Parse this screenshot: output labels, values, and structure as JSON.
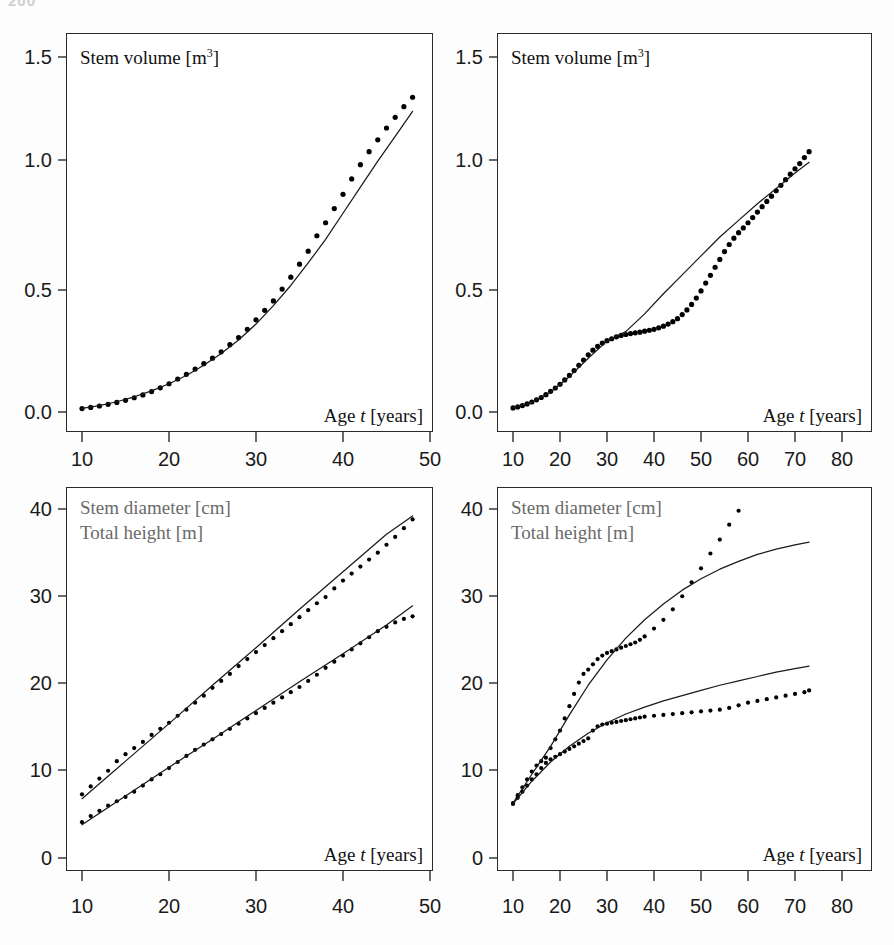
{
  "page": {
    "number": "200"
  },
  "figure": {
    "panels": [
      {
        "id": "top-left",
        "captions": {
          "title": "Stem volume [m",
          "title_sup": "3",
          "title_end": "]",
          "xlabel_a": "Age ",
          "xlabel_t": "t",
          "xlabel_b": " [years]"
        },
        "yticks": [
          "0.0",
          "0.5",
          "1.0",
          "1.5"
        ],
        "xticks": [
          "10",
          "20",
          "30",
          "40",
          "50"
        ]
      },
      {
        "id": "top-right",
        "captions": {
          "title": "Stem volume [m",
          "title_sup": "3",
          "title_end": "]",
          "xlabel_a": "Age ",
          "xlabel_t": "t",
          "xlabel_b": " [years]"
        },
        "yticks": [
          "0.0",
          "0.5",
          "1.0",
          "1.5"
        ],
        "xticks": [
          "10",
          "20",
          "30",
          "40",
          "50",
          "60",
          "70",
          "80"
        ]
      },
      {
        "id": "bottom-left",
        "captions": {
          "title1": "Stem diameter [cm]",
          "title2": "Total height [m]",
          "xlabel_a": "Age ",
          "xlabel_t": "t",
          "xlabel_b": " [years]"
        },
        "yticks": [
          "0",
          "10",
          "20",
          "30",
          "40"
        ],
        "xticks": [
          "10",
          "20",
          "30",
          "40",
          "50"
        ]
      },
      {
        "id": "bottom-right",
        "captions": {
          "title1": "Stem diameter [cm]",
          "title2": "Total height [m]",
          "xlabel_a": "Age ",
          "xlabel_t": "t",
          "xlabel_b": " [years]"
        },
        "yticks": [
          "0",
          "10",
          "20",
          "30",
          "40"
        ],
        "xticks": [
          "10",
          "20",
          "30",
          "40",
          "50",
          "60",
          "70",
          "80"
        ]
      }
    ]
  },
  "colors": {
    "frame": "#2a2a2a",
    "curve": "#1a1a1a",
    "marker": "#000000",
    "caption_gray": "#6a6a6a",
    "background": "#ffffff"
  },
  "chart_data": [
    {
      "type": "line",
      "panel": "top-left",
      "title": "Stem volume [m3]",
      "xlabel": "Age t [years]",
      "ylabel": "Stem volume [m3]",
      "xlim": [
        10,
        50
      ],
      "ylim": [
        0.0,
        1.5
      ],
      "xticks": [
        10,
        20,
        30,
        40,
        50
      ],
      "yticks": [
        0.0,
        0.5,
        1.0,
        1.5
      ],
      "grid": false,
      "legend": "none",
      "series": [
        {
          "name": "Observed stem volume (points)",
          "style": "points",
          "x": [
            10,
            11,
            12,
            13,
            14,
            15,
            16,
            17,
            18,
            19,
            20,
            21,
            22,
            23,
            24,
            25,
            26,
            27,
            28,
            29,
            30,
            31,
            32,
            33,
            34,
            35,
            36,
            37,
            38,
            39,
            40,
            41,
            42,
            43,
            44,
            45,
            46,
            47,
            48
          ],
          "y": [
            0.015,
            0.02,
            0.026,
            0.033,
            0.041,
            0.05,
            0.061,
            0.073,
            0.087,
            0.103,
            0.12,
            0.14,
            0.16,
            0.182,
            0.205,
            0.228,
            0.255,
            0.285,
            0.315,
            0.35,
            0.39,
            0.43,
            0.47,
            0.52,
            0.57,
            0.625,
            0.68,
            0.745,
            0.8,
            0.86,
            0.92,
            0.985,
            1.045,
            1.1,
            1.15,
            1.2,
            1.245,
            1.29,
            1.33
          ]
        },
        {
          "name": "Model fit (solid line)",
          "style": "line",
          "x": [
            10,
            12,
            14,
            16,
            18,
            20,
            22,
            24,
            26,
            28,
            30,
            32,
            34,
            36,
            38,
            40,
            42,
            44,
            46,
            48
          ],
          "y": [
            0.016,
            0.028,
            0.044,
            0.065,
            0.09,
            0.12,
            0.155,
            0.198,
            0.248,
            0.305,
            0.372,
            0.45,
            0.535,
            0.63,
            0.73,
            0.84,
            0.95,
            1.06,
            1.165,
            1.27
          ]
        }
      ]
    },
    {
      "type": "line",
      "panel": "top-right",
      "title": "Stem volume [m3]",
      "xlabel": "Age t [years]",
      "ylabel": "Stem volume [m3]",
      "xlim": [
        10,
        80
      ],
      "ylim": [
        0.0,
        1.5
      ],
      "xticks": [
        10,
        20,
        30,
        40,
        50,
        60,
        70,
        80
      ],
      "yticks": [
        0.0,
        0.5,
        1.0,
        1.5
      ],
      "grid": false,
      "legend": "none",
      "series": [
        {
          "name": "Observed stem volume (points)",
          "style": "points",
          "x": [
            10,
            11,
            12,
            13,
            14,
            15,
            16,
            17,
            18,
            19,
            20,
            21,
            22,
            23,
            24,
            25,
            26,
            27,
            28,
            29,
            30,
            31,
            32,
            33,
            34,
            35,
            36,
            37,
            38,
            39,
            40,
            41,
            42,
            43,
            44,
            45,
            46,
            47,
            48,
            49,
            50,
            51,
            52,
            53,
            54,
            55,
            56,
            57,
            58,
            59,
            60,
            61,
            62,
            63,
            64,
            65,
            66,
            67,
            68,
            69,
            70,
            71,
            72,
            73
          ],
          "y": [
            0.018,
            0.022,
            0.028,
            0.035,
            0.043,
            0.052,
            0.062,
            0.074,
            0.088,
            0.102,
            0.118,
            0.136,
            0.155,
            0.176,
            0.198,
            0.22,
            0.242,
            0.262,
            0.278,
            0.292,
            0.302,
            0.31,
            0.318,
            0.324,
            0.328,
            0.332,
            0.335,
            0.338,
            0.342,
            0.346,
            0.35,
            0.356,
            0.363,
            0.372,
            0.382,
            0.395,
            0.412,
            0.432,
            0.455,
            0.482,
            0.512,
            0.545,
            0.578,
            0.612,
            0.645,
            0.678,
            0.708,
            0.735,
            0.758,
            0.778,
            0.8,
            0.822,
            0.845,
            0.868,
            0.89,
            0.912,
            0.935,
            0.958,
            0.982,
            1.005,
            1.028,
            1.05,
            1.075,
            1.1
          ]
        },
        {
          "name": "Model fit (solid line)",
          "style": "line",
          "x": [
            10,
            14,
            18,
            22,
            26,
            30,
            34,
            38,
            42,
            46,
            50,
            54,
            58,
            62,
            66,
            70,
            73
          ],
          "y": [
            0.018,
            0.042,
            0.085,
            0.15,
            0.228,
            0.3,
            0.34,
            0.415,
            0.5,
            0.58,
            0.66,
            0.74,
            0.81,
            0.88,
            0.945,
            1.01,
            1.055
          ]
        }
      ]
    },
    {
      "type": "line",
      "panel": "bottom-left",
      "title": "Stem diameter [cm] / Total height [m]",
      "xlabel": "Age t [years]",
      "ylabel": "Stem diameter [cm], Total height [m]",
      "xlim": [
        10,
        50
      ],
      "ylim": [
        0,
        40
      ],
      "xticks": [
        10,
        20,
        30,
        40,
        50
      ],
      "yticks": [
        0,
        10,
        20,
        30,
        40
      ],
      "grid": false,
      "legend": "none",
      "series": [
        {
          "name": "Observed stem diameter (points)",
          "style": "points",
          "x": [
            10,
            11,
            12,
            13,
            14,
            15,
            16,
            17,
            18,
            19,
            20,
            21,
            22,
            23,
            24,
            25,
            26,
            27,
            28,
            29,
            30,
            31,
            32,
            33,
            34,
            35,
            36,
            37,
            38,
            39,
            40,
            41,
            42,
            43,
            44,
            45,
            46,
            47,
            48
          ],
          "y": [
            7.3,
            8.2,
            9.1,
            10.0,
            11.1,
            11.9,
            12.6,
            13.3,
            14.1,
            14.8,
            15.5,
            16.3,
            17.0,
            17.8,
            18.6,
            19.5,
            20.3,
            21.1,
            22.0,
            22.8,
            23.6,
            24.4,
            25.2,
            26.0,
            26.8,
            27.6,
            28.4,
            29.2,
            29.9,
            30.9,
            31.8,
            32.6,
            33.4,
            34.2,
            35.0,
            35.9,
            36.8,
            37.8,
            38.8
          ]
        },
        {
          "name": "Model fit stem diameter (solid line)",
          "style": "line",
          "x": [
            10,
            15,
            20,
            25,
            30,
            35,
            40,
            45,
            48
          ],
          "y": [
            6.8,
            11.1,
            15.4,
            19.8,
            24.1,
            28.5,
            32.8,
            37.1,
            39.2
          ]
        },
        {
          "name": "Observed total height (points)",
          "style": "points",
          "x": [
            10,
            11,
            12,
            13,
            14,
            15,
            16,
            17,
            18,
            19,
            20,
            21,
            22,
            23,
            24,
            25,
            26,
            27,
            28,
            29,
            30,
            31,
            32,
            33,
            34,
            35,
            36,
            37,
            38,
            39,
            40,
            41,
            42,
            43,
            44,
            45,
            46,
            47,
            48
          ],
          "y": [
            4.1,
            4.8,
            5.4,
            6.0,
            6.5,
            7.0,
            7.6,
            8.3,
            9.0,
            9.6,
            10.3,
            11.0,
            11.7,
            12.4,
            13.0,
            13.6,
            14.2,
            14.8,
            15.4,
            16.0,
            16.6,
            17.2,
            17.8,
            18.4,
            19.0,
            19.6,
            20.3,
            21.0,
            21.8,
            22.5,
            23.2,
            23.9,
            24.6,
            25.3,
            26.0,
            26.5,
            27.0,
            27.4,
            27.7
          ]
        },
        {
          "name": "Model fit total height (solid line)",
          "style": "line",
          "x": [
            10,
            15,
            20,
            25,
            30,
            35,
            40,
            45,
            48
          ],
          "y": [
            3.8,
            7.1,
            10.4,
            13.6,
            16.9,
            20.2,
            23.4,
            26.7,
            28.9
          ]
        }
      ]
    },
    {
      "type": "line",
      "panel": "bottom-right",
      "title": "Stem diameter [cm] / Total height [m]",
      "xlabel": "Age t [years]",
      "ylabel": "Stem diameter [cm], Total height [m]",
      "xlim": [
        10,
        80
      ],
      "ylim": [
        0,
        40
      ],
      "xticks": [
        10,
        20,
        30,
        40,
        50,
        60,
        70,
        80
      ],
      "yticks": [
        0,
        10,
        20,
        30,
        40
      ],
      "grid": false,
      "legend": "none",
      "series": [
        {
          "name": "Observed stem diameter (points)",
          "style": "points",
          "x": [
            10,
            11,
            12,
            13,
            14,
            15,
            16,
            17,
            18,
            19,
            20,
            21,
            22,
            23,
            24,
            25,
            26,
            27,
            28,
            29,
            30,
            31,
            32,
            33,
            34,
            35,
            36,
            37,
            38,
            40,
            42,
            44,
            46,
            48,
            50,
            52,
            54,
            56,
            58
          ],
          "y": [
            6.3,
            7.2,
            8.1,
            9.0,
            9.9,
            10.6,
            11.1,
            11.5,
            12.6,
            13.6,
            14.6,
            16.0,
            17.4,
            18.8,
            20.1,
            21.1,
            21.6,
            22.2,
            22.8,
            23.2,
            23.5,
            23.7,
            23.9,
            24.1,
            24.3,
            24.5,
            24.7,
            25.0,
            25.4,
            26.3,
            27.3,
            28.5,
            30.0,
            31.6,
            33.2,
            34.9,
            36.5,
            38.2,
            39.8
          ]
        },
        {
          "name": "Model fit stem diameter (solid line)",
          "style": "line",
          "x": [
            10,
            14,
            18,
            22,
            26,
            30,
            34,
            38,
            42,
            46,
            50,
            54,
            58,
            62,
            66,
            70,
            73
          ],
          "y": [
            6.3,
            9.6,
            12.8,
            16.4,
            19.8,
            22.7,
            25.2,
            27.3,
            29.1,
            30.7,
            32.0,
            33.1,
            34.0,
            34.8,
            35.4,
            35.9,
            36.2
          ]
        },
        {
          "name": "Observed total height (points)",
          "style": "points",
          "x": [
            10,
            11,
            12,
            13,
            14,
            15,
            16,
            17,
            18,
            19,
            20,
            21,
            22,
            23,
            24,
            25,
            26,
            27,
            28,
            29,
            30,
            31,
            32,
            33,
            34,
            35,
            36,
            37,
            38,
            40,
            42,
            44,
            46,
            48,
            50,
            52,
            54,
            56,
            58,
            60,
            62,
            64,
            66,
            68,
            70,
            72,
            73
          ],
          "y": [
            6.2,
            6.9,
            7.6,
            8.3,
            9.0,
            9.6,
            10.3,
            10.9,
            11.3,
            11.6,
            11.9,
            12.2,
            12.5,
            12.8,
            13.1,
            13.4,
            13.7,
            14.6,
            15.1,
            15.3,
            15.4,
            15.5,
            15.6,
            15.7,
            15.8,
            15.9,
            16.0,
            16.1,
            16.2,
            16.3,
            16.4,
            16.5,
            16.6,
            16.7,
            16.8,
            16.9,
            17.0,
            17.2,
            17.5,
            17.8,
            18.0,
            18.2,
            18.4,
            18.6,
            18.8,
            19.0,
            19.2
          ]
        },
        {
          "name": "Model fit total height (solid line)",
          "style": "line",
          "x": [
            10,
            14,
            18,
            22,
            26,
            30,
            34,
            38,
            42,
            46,
            50,
            54,
            58,
            62,
            66,
            70,
            73
          ],
          "y": [
            6.2,
            8.8,
            11.0,
            12.8,
            14.3,
            15.5,
            16.5,
            17.3,
            18.0,
            18.6,
            19.2,
            19.8,
            20.3,
            20.8,
            21.3,
            21.7,
            22.0
          ]
        }
      ]
    }
  ]
}
